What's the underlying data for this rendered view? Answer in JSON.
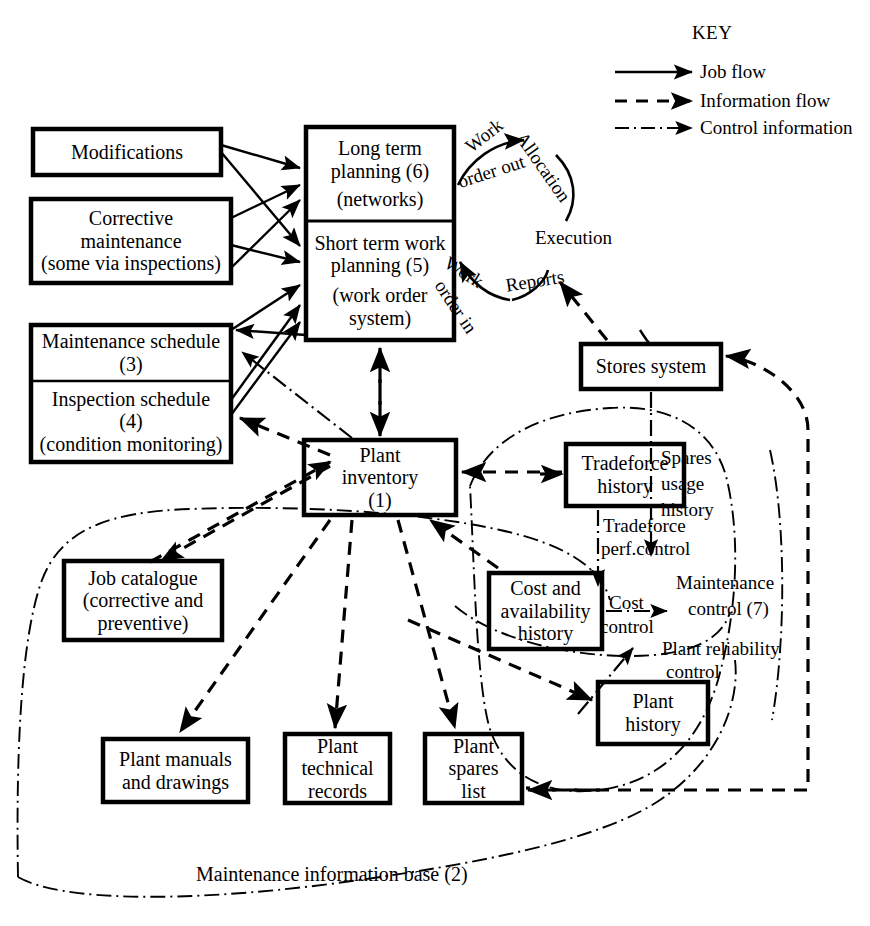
{
  "diagram": {
    "caption": "Maintenance information base (2)",
    "key": {
      "title": "KEY",
      "entries": [
        {
          "id": "job-flow",
          "label": "Job flow",
          "style": "solid"
        },
        {
          "id": "information-flow",
          "label": "Information flow",
          "style": "dashed"
        },
        {
          "id": "control-information",
          "label": "Control information",
          "style": "dash-dot"
        }
      ]
    },
    "boxes": [
      {
        "id": "modifications",
        "lines": [
          "Modifications"
        ],
        "x": 33,
        "y": 129,
        "w": 188,
        "h": 46
      },
      {
        "id": "corrective-maintenance",
        "lines": [
          "Corrective",
          "maintenance",
          "(some via inspections)"
        ],
        "x": 31,
        "y": 199,
        "w": 200,
        "h": 84
      },
      {
        "id": "maintenance-schedule",
        "lines": [
          "Maintenance schedule",
          "(3)"
        ],
        "x": 31,
        "y": 325,
        "w": 200,
        "h": 56
      },
      {
        "id": "inspection-schedule",
        "lines": [
          "Inspection schedule",
          "(4)",
          "(condition monitoring)"
        ],
        "x": 31,
        "y": 381,
        "w": 200,
        "h": 81
      },
      {
        "id": "long-term-planning",
        "lines": [
          "Long term",
          "planning (6)",
          "(networks)"
        ],
        "x": 306,
        "y": 127,
        "w": 148,
        "h": 94
      },
      {
        "id": "short-term-work-planning",
        "lines": [
          "Short term work",
          "planning (5)",
          "(work order",
          "system)"
        ],
        "x": 306,
        "y": 221,
        "w": 148,
        "h": 119
      },
      {
        "id": "plant-inventory",
        "lines": [
          "Plant",
          "inventory",
          "(1)"
        ],
        "x": 304,
        "y": 440,
        "w": 152,
        "h": 75
      },
      {
        "id": "stores-system",
        "lines": [
          "Stores system"
        ],
        "x": 581,
        "y": 344,
        "w": 140,
        "h": 45
      },
      {
        "id": "tradeforce-history",
        "lines": [
          "Tradeforce",
          "history"
        ],
        "x": 566,
        "y": 444,
        "w": 118,
        "h": 62
      },
      {
        "id": "cost-and-availability-history",
        "lines": [
          "Cost and",
          "availability",
          "history"
        ],
        "x": 489,
        "y": 573,
        "w": 113,
        "h": 76
      },
      {
        "id": "job-catalogue",
        "lines": [
          "Job catalogue",
          "(corrective and",
          "preventive)"
        ],
        "x": 64,
        "y": 561,
        "w": 158,
        "h": 79
      },
      {
        "id": "plant-manuals-and-drawings",
        "lines": [
          "Plant manuals",
          "and drawings"
        ],
        "x": 103,
        "y": 739,
        "w": 145,
        "h": 63
      },
      {
        "id": "plant-technical-records",
        "lines": [
          "Plant",
          "technical",
          "records"
        ],
        "x": 285,
        "y": 734,
        "w": 105,
        "h": 69
      },
      {
        "id": "plant-spares-list",
        "lines": [
          "Plant",
          "spares",
          "list"
        ],
        "x": 425,
        "y": 734,
        "w": 97,
        "h": 69
      },
      {
        "id": "plant-history",
        "lines": [
          "Plant",
          "history"
        ],
        "x": 598,
        "y": 682,
        "w": 110,
        "h": 62
      }
    ],
    "edge_labels": [
      {
        "id": "work-order-out",
        "text": "Work",
        "text2": "order out"
      },
      {
        "id": "allocation",
        "text": "Allocation"
      },
      {
        "id": "execution",
        "text": "Execution"
      },
      {
        "id": "work-order-in",
        "text": "Work",
        "text2": "order in"
      },
      {
        "id": "reports",
        "text": "Reports"
      },
      {
        "id": "spares-usage-history",
        "lines": [
          "Spares",
          "usage",
          "history"
        ]
      },
      {
        "id": "tradeforce-perf-control",
        "lines": [
          "Tradeforce",
          "perf.control"
        ]
      },
      {
        "id": "cost-control",
        "lines": [
          "Cost",
          "control"
        ]
      },
      {
        "id": "maintenance-control",
        "lines": [
          "Maintenance",
          "control (7)"
        ]
      },
      {
        "id": "plant-reliability-control",
        "lines": [
          "Plant reliability",
          "control"
        ]
      }
    ],
    "colors": {
      "ink": "#000000",
      "paper": "#ffffff"
    }
  }
}
